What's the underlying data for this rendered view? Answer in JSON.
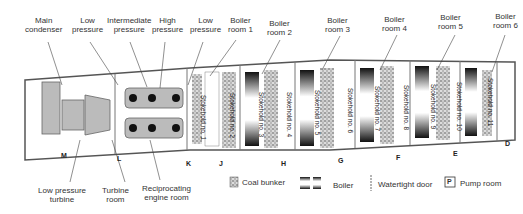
{
  "top_labels": [
    {
      "id": "main-condenser",
      "text": "Main\ncondenser"
    },
    {
      "id": "low-pressure-cyl",
      "text": "Low\npressure"
    },
    {
      "id": "intermediate-pressure",
      "text": "Intermediate\npressure"
    },
    {
      "id": "high-pressure",
      "text": "High\npressure"
    },
    {
      "id": "low-pressure-2",
      "text": "Low\npressure"
    },
    {
      "id": "boiler-room-1",
      "text": "Boiler\nroom 1"
    },
    {
      "id": "boiler-room-2",
      "text": "Boiler\nroom 2"
    },
    {
      "id": "boiler-room-3",
      "text": "Boiler\nroom 3"
    },
    {
      "id": "boiler-room-4",
      "text": "Boiler\nroom 4"
    },
    {
      "id": "boiler-room-5",
      "text": "Boiler\nroom 5"
    },
    {
      "id": "boiler-room-6",
      "text": "Boiler\nroom 6"
    }
  ],
  "bottom_labels": [
    {
      "id": "low-pressure-turbine",
      "text": "Low pressure\nturbine"
    },
    {
      "id": "turbine-room",
      "text": "Turbine\nroom"
    },
    {
      "id": "reciprocating-engine-room",
      "text": "Reciprocating\nengine room"
    }
  ],
  "bulkheads": [
    "M",
    "L",
    "K",
    "J",
    "H",
    "G",
    "F",
    "E",
    "D"
  ],
  "stokeholds": [
    "Stokehold no. 1",
    "Stokehold no. 2",
    "Stokehold no. 3",
    "Stokehold no. 4",
    "Stokehold no. 5",
    "Stokehold no. 6",
    "Stokehold no. 7",
    "Stokehold no. 8",
    "Stokehold no. 9",
    "Stokehold no. 10",
    "Stokehold no. 11"
  ],
  "pump_room_mark": "P",
  "legend": {
    "coal_bunker": "Coal bunker",
    "boiler": "Boiler",
    "watertight_door": "Watertight door",
    "pump_room": "Pump room",
    "pump_symbol": "P"
  },
  "colors": {
    "hull": "#555555",
    "machinery": "#bbbbbb",
    "boiler_dark": "#111111"
  }
}
